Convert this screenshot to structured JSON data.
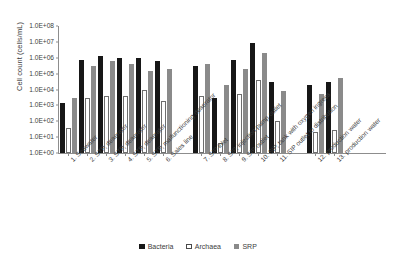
{
  "chart_data": {
    "type": "bar",
    "title": "",
    "xlabel": "",
    "ylabel": "Cell count (cells/mL)",
    "scale": "log",
    "ylim": [
      1,
      100000000
    ],
    "ytick_labels": [
      "1.0E+08",
      "1.0E+07",
      "1.0E+06",
      "1.0E+05",
      "1.0E+04",
      "1.0E+03",
      "1.0E+02",
      "1.0E+01",
      "1.0E+00"
    ],
    "ytick_values": [
      100000000,
      10000000,
      1000000,
      100000,
      10000,
      1000,
      100,
      10,
      1
    ],
    "grid": false,
    "legend_position": "bottom",
    "categories": [
      "1. Seawater",
      "2. STP, deaerator",
      "3. STP, deaerator",
      "4. STP, deaerator",
      "5. STP, malfunctioning deaerator",
      "6. Sales line",
      "7. SIP inlet",
      "8. SIP, injection pump outlet",
      "9. SIP outlet",
      "10. SIP, tank with oxygen ingress",
      "11. SIP outlet to distribution",
      "12. production water",
      "13. production water"
    ],
    "series": [
      {
        "name": "Bacteria",
        "color": "#171717",
        "values": [
          1500,
          700000,
          1300000,
          900000,
          900000,
          600000,
          300000,
          3000,
          700000,
          9000000,
          30000,
          20000,
          30000
        ]
      },
      {
        "name": "Archaea",
        "color": "#ffffff",
        "values": [
          40,
          3000,
          4000,
          4000,
          9000,
          2000,
          4000,
          4,
          5000,
          40000,
          100,
          20,
          30
        ]
      },
      {
        "name": "SRP",
        "color": "#8a8a8a",
        "values": [
          3000,
          300000,
          600000,
          400000,
          150000,
          200000,
          400000,
          20000,
          200000,
          2000000,
          8000,
          5000,
          50000
        ]
      }
    ]
  },
  "legend": {
    "items": [
      {
        "label": "Bacteria",
        "key": "bacteria"
      },
      {
        "label": "Archaea",
        "key": "archaea"
      },
      {
        "label": "SRP",
        "key": "srp"
      }
    ]
  }
}
